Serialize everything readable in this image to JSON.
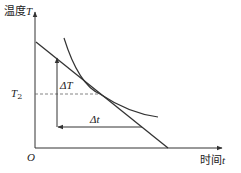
{
  "diagram": {
    "y_axis_label": "温度",
    "y_axis_var": "T",
    "x_axis_label": "时间",
    "x_axis_var": "t",
    "origin_label": "O",
    "t2_label": "T",
    "t2_sub": "2",
    "delta_T_label": "ΔT",
    "delta_t_label": "Δt",
    "line_color": "#333333",
    "dash_color": "#666666"
  }
}
